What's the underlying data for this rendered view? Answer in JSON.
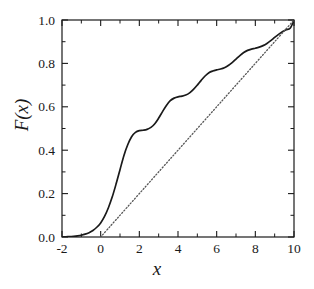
{
  "chart_data": {
    "type": "line",
    "title": "",
    "xlabel": "x",
    "ylabel": "F(x)",
    "xlim": [
      -2,
      10
    ],
    "ylim": [
      0.0,
      1.0
    ],
    "grid": false,
    "legend": "none",
    "x_ticks": [
      "-2",
      "0",
      "2",
      "4",
      "6",
      "8",
      "10"
    ],
    "x_tick_values": [
      -2,
      0,
      2,
      4,
      6,
      8,
      10
    ],
    "x_minor_tick_values": [
      -1,
      1,
      3,
      5,
      7,
      9
    ],
    "y_ticks": [
      "0.0",
      "0.2",
      "0.4",
      "0.6",
      "0.8",
      "1.0"
    ],
    "y_tick_values": [
      0.0,
      0.2,
      0.4,
      0.6,
      0.8,
      1.0
    ],
    "y_minor_tick_values": [
      0.1,
      0.3,
      0.5,
      0.7,
      0.9
    ],
    "series": [
      {
        "name": "staircase-cdf",
        "style": "solid",
        "color": "#1a1a1a",
        "x": [
          -2.0,
          -1.8,
          -1.6,
          -1.4,
          -1.2,
          -1.0,
          -0.8,
          -0.6,
          -0.4,
          -0.2,
          0.0,
          0.2,
          0.4,
          0.6,
          0.8,
          1.0,
          1.2,
          1.4,
          1.6,
          1.8,
          2.0,
          2.2,
          2.4,
          2.6,
          2.8,
          3.0,
          3.2,
          3.4,
          3.6,
          3.8,
          4.0,
          4.2,
          4.4,
          4.6,
          4.8,
          5.0,
          5.2,
          5.4,
          5.6,
          5.8,
          6.0,
          6.2,
          6.4,
          6.6,
          6.8,
          7.0,
          7.2,
          7.4,
          7.6,
          7.8,
          8.0,
          8.2,
          8.4,
          8.6,
          8.8,
          9.0,
          9.2,
          9.4,
          9.6,
          9.8,
          10.0
        ],
        "y": [
          0.0,
          0.001,
          0.002,
          0.003,
          0.005,
          0.008,
          0.013,
          0.02,
          0.03,
          0.045,
          0.065,
          0.095,
          0.135,
          0.185,
          0.245,
          0.31,
          0.375,
          0.425,
          0.462,
          0.482,
          0.49,
          0.492,
          0.496,
          0.505,
          0.522,
          0.548,
          0.578,
          0.606,
          0.628,
          0.64,
          0.646,
          0.649,
          0.654,
          0.664,
          0.68,
          0.7,
          0.722,
          0.742,
          0.757,
          0.765,
          0.77,
          0.774,
          0.78,
          0.79,
          0.804,
          0.82,
          0.836,
          0.85,
          0.86,
          0.866,
          0.87,
          0.875,
          0.882,
          0.892,
          0.905,
          0.92,
          0.934,
          0.946,
          0.955,
          0.962,
          0.998
        ]
      },
      {
        "name": "linear-reference",
        "style": "dotted",
        "color": "#555555",
        "x": [
          0.0,
          10.0
        ],
        "y": [
          0.0,
          1.0
        ]
      }
    ]
  }
}
